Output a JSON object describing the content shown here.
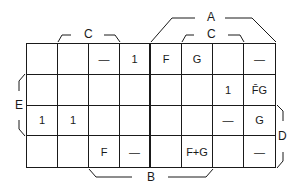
{
  "diagram": {
    "type": "karnaugh-map",
    "rows": 4,
    "columns": 8,
    "cells": [
      [
        "",
        "",
        "—",
        "1",
        "F",
        "G",
        "",
        "—"
      ],
      [
        "",
        "",
        "",
        "",
        "",
        "",
        "1",
        "F̄G"
      ],
      [
        "1",
        "1",
        "",
        "",
        "",
        "",
        "—",
        "G"
      ],
      [
        "",
        "",
        "F",
        "—",
        "",
        "F+G",
        "",
        "—"
      ]
    ],
    "labels": {
      "A": "A",
      "B": "B",
      "C_left": "C",
      "C_right": "C",
      "D": "D",
      "E": "E"
    }
  }
}
